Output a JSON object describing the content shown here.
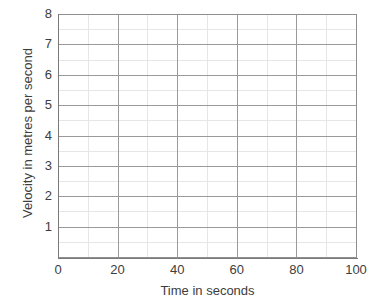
{
  "chart_data": {
    "type": "line",
    "title": "",
    "subtitle": "",
    "xlabel": "Time in seconds",
    "ylabel": "Velocity in metres per second",
    "xlim": [
      0,
      100
    ],
    "ylim": [
      0,
      8
    ],
    "x_ticks": [
      0,
      20,
      40,
      60,
      80,
      100
    ],
    "x_tick_labels": [
      "0",
      "20",
      "40",
      "60",
      "80",
      "100"
    ],
    "y_ticks": [
      1,
      2,
      3,
      4,
      5,
      6,
      7,
      8
    ],
    "y_tick_labels": [
      "1",
      "2",
      "3",
      "4",
      "5",
      "6",
      "7",
      "8"
    ],
    "x_major_step": 20,
    "x_minor_step": 10,
    "y_major_step": 1,
    "y_minor_step": 0.5,
    "grid": true,
    "grid_major_color": "#9a9a9a",
    "grid_minor_color": "#e6e6e6",
    "axis_color": "#7a7a7a",
    "background_color": "#ffffff",
    "legend": null,
    "legend_position": "none",
    "series": [],
    "annotations": [],
    "note": "Empty plotting grid with no plotted data series."
  },
  "axes": {
    "x_title": "Time in seconds",
    "y_title": "Velocity in metres per second"
  }
}
